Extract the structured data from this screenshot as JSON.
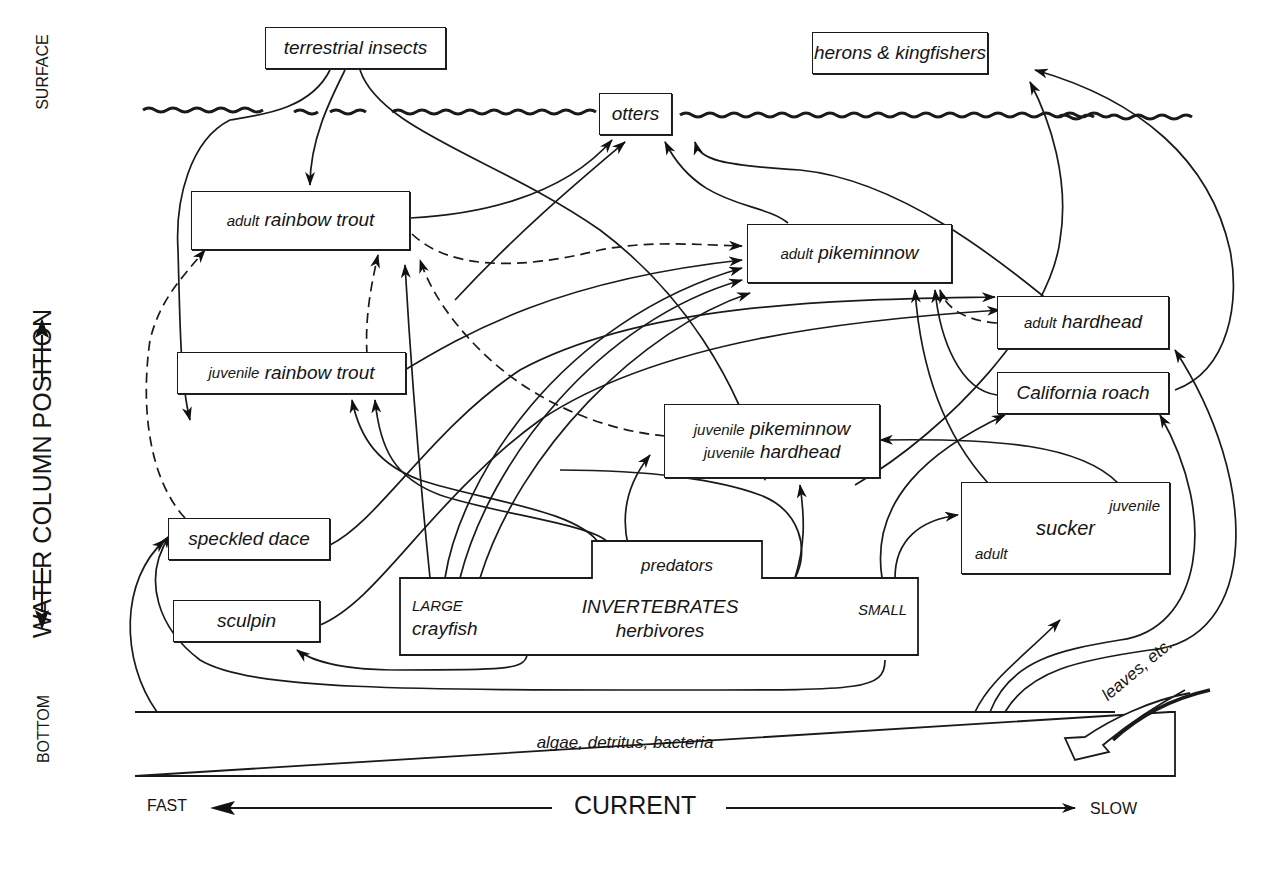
{
  "diagram": {
    "nodes": {
      "terrestrial_insects": "terrestrial insects",
      "herons": "herons & kingfishers",
      "otters": "otters",
      "adult_trout": {
        "prefix": "adult",
        "name": "rainbow trout"
      },
      "adult_pikeminnow": {
        "prefix": "adult",
        "name": "pikeminnow"
      },
      "adult_hardhead": {
        "prefix": "adult",
        "name": "hardhead"
      },
      "juvenile_trout": {
        "prefix": "juvenile",
        "name": "rainbow trout"
      },
      "california_roach": "California roach",
      "juvenile_pike_hard": {
        "line1_prefix": "juvenile",
        "line1_name": "pikeminnow",
        "line2_prefix": "juvenile",
        "line2_name": "hardhead"
      },
      "sucker": {
        "top": "juvenile",
        "name": "sucker",
        "bottom": "adult"
      },
      "speckled_dace": "speckled dace",
      "sculpin": "sculpin",
      "invertebrates": {
        "top": "predators",
        "left_top": "LARGE",
        "left_bottom": "crayfish",
        "center": "INVERTEBRATES",
        "center_bottom": "herbivores",
        "right": "SMALL"
      },
      "algae": "algae, detritus, bacteria"
    },
    "input_label": "leaves, etc.",
    "axes": {
      "vertical": {
        "bottom": "BOTTOM",
        "title": "WATER COLUMN POSITION",
        "top": "SURFACE"
      },
      "horizontal": {
        "left": "FAST",
        "title": "CURRENT",
        "right": "SLOW"
      }
    },
    "legend": {
      "solid": "feeding link (solid arrow)",
      "dashed": "ontogenetic / minor link (dashed arrow)"
    },
    "colors": {
      "ink": "#1a1a1a",
      "background": "#ffffff"
    }
  }
}
